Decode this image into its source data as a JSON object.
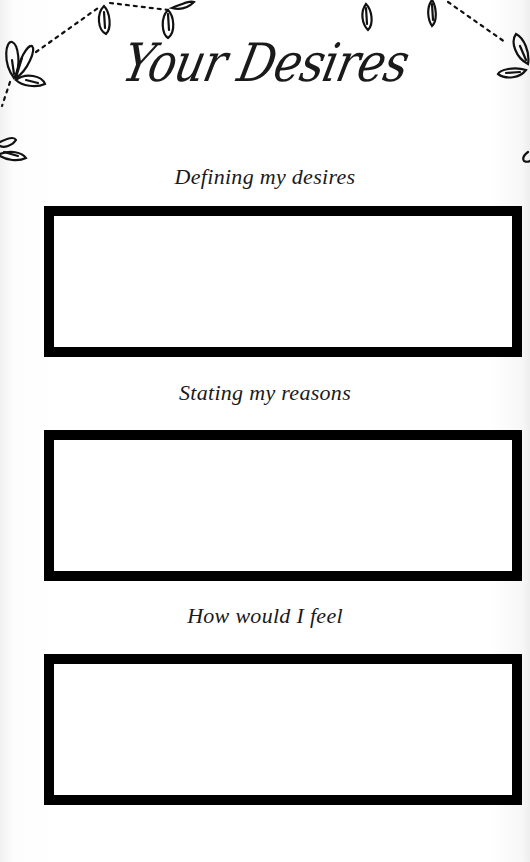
{
  "page": {
    "title": "Your Desires",
    "sections": [
      {
        "label": "Defining my desires",
        "content": ""
      },
      {
        "label": "Stating my reasons",
        "content": ""
      },
      {
        "label": "How would I feel",
        "content": ""
      }
    ]
  },
  "colors": {
    "ink": "#000000",
    "background": "#ffffff"
  },
  "decorations": {
    "top": "leaf-garland-icon"
  }
}
